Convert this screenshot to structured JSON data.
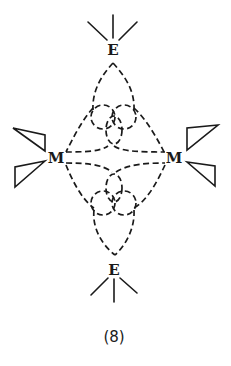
{
  "figure": {
    "caption": "(8)",
    "atoms": {
      "top": "E",
      "bottom": "E",
      "left": "M",
      "right": "M"
    },
    "substituents": {
      "E": "three solid lines (trigonal substituents)",
      "M": "two open wedge ligands each"
    },
    "colors": {
      "ink": "#1a1a1a",
      "background": "#ffffff"
    }
  }
}
